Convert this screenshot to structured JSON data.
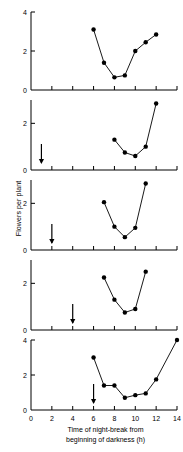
{
  "figure": {
    "axis_titles": {
      "y": "Flowers per plant",
      "x_line1": "Time of night-break from",
      "x_line2": "beginning of darkness (h)"
    },
    "colors": {
      "ink": "#000000",
      "background": "#ffffff"
    }
  },
  "chart_data": [
    {
      "type": "line",
      "panel": 1,
      "title": "",
      "xlabel": "Time of night-break from beginning of darkness (h)",
      "ylabel": "Flowers per plant",
      "xlim": [
        0,
        14
      ],
      "ylim": [
        0,
        4
      ],
      "xticks": [
        0,
        2,
        4,
        6,
        8,
        10,
        12,
        14
      ],
      "yticks": [
        0,
        2,
        4
      ],
      "ytick_labels": [
        "0",
        "2",
        "4"
      ],
      "xtick_labels": [
        "",
        "",
        "",
        "",
        "",
        "",
        "",
        ""
      ],
      "grid": false,
      "legend": null,
      "marker": "filled-circle",
      "arrow": null,
      "x": [
        6,
        7,
        8,
        9,
        10,
        11,
        12
      ],
      "values": [
        3.1,
        1.4,
        0.65,
        0.75,
        2.0,
        2.45,
        2.85
      ]
    },
    {
      "type": "line",
      "panel": 2,
      "xlim": [
        0,
        14
      ],
      "ylim": [
        0,
        3
      ],
      "xticks": [
        0,
        2,
        4,
        6,
        8,
        10,
        12,
        14
      ],
      "yticks": [
        0,
        2
      ],
      "ytick_labels": [
        "0",
        "2"
      ],
      "xtick_labels": [
        "",
        "",
        "",
        "",
        "",
        "",
        "",
        ""
      ],
      "grid": false,
      "marker": "filled-circle",
      "arrow": {
        "x": 1,
        "label": "night-break-marker"
      },
      "x": [
        8,
        9,
        10,
        11,
        12
      ],
      "values": [
        1.3,
        0.75,
        0.6,
        1.0,
        2.85
      ]
    },
    {
      "type": "line",
      "panel": 3,
      "xlim": [
        0,
        14
      ],
      "ylim": [
        0,
        3
      ],
      "xticks": [
        0,
        2,
        4,
        6,
        8,
        10,
        12,
        14
      ],
      "yticks": [
        0,
        2
      ],
      "ytick_labels": [
        "0",
        "2"
      ],
      "xtick_labels": [
        "",
        "",
        "",
        "",
        "",
        "",
        "",
        ""
      ],
      "grid": false,
      "marker": "filled-circle",
      "arrow": {
        "x": 2,
        "label": "night-break-marker"
      },
      "x": [
        7,
        8,
        9,
        10,
        11
      ],
      "values": [
        2.05,
        1.0,
        0.55,
        0.95,
        2.85
      ]
    },
    {
      "type": "line",
      "panel": 4,
      "xlim": [
        0,
        14
      ],
      "ylim": [
        0,
        3
      ],
      "xticks": [
        0,
        2,
        4,
        6,
        8,
        10,
        12,
        14
      ],
      "yticks": [
        0,
        2
      ],
      "ytick_labels": [
        "0",
        "2"
      ],
      "xtick_labels": [
        "",
        "",
        "",
        "",
        "",
        "",
        "",
        ""
      ],
      "grid": false,
      "marker": "filled-circle",
      "arrow": {
        "x": 4,
        "label": "night-break-marker"
      },
      "x": [
        7,
        8,
        9,
        10,
        11
      ],
      "values": [
        2.25,
        1.3,
        0.75,
        0.9,
        2.5
      ]
    },
    {
      "type": "line",
      "panel": 5,
      "xlim": [
        0,
        14
      ],
      "ylim": [
        0,
        4
      ],
      "xticks": [
        0,
        2,
        4,
        6,
        8,
        10,
        12,
        14
      ],
      "yticks": [
        0,
        2,
        4
      ],
      "ytick_labels": [
        "0",
        "2",
        "4"
      ],
      "xtick_labels": [
        "0",
        "2",
        "4",
        "6",
        "8",
        "10",
        "12",
        "14"
      ],
      "grid": false,
      "marker": "filled-circle",
      "arrow": {
        "x": 6,
        "label": "night-break-marker"
      },
      "x": [
        6,
        7,
        8,
        9,
        10,
        11,
        12,
        14
      ],
      "values": [
        3.0,
        1.4,
        1.4,
        0.7,
        0.85,
        0.95,
        1.75,
        4.0
      ]
    }
  ]
}
